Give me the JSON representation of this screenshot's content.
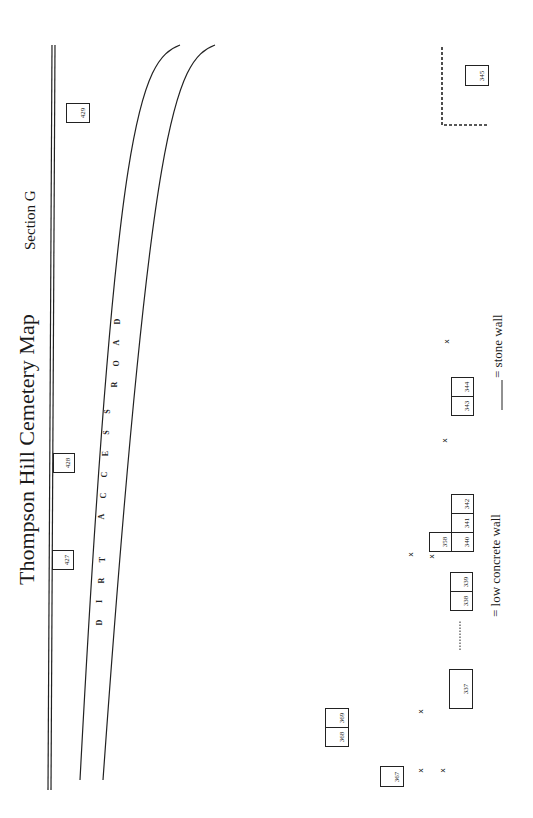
{
  "title": "Thompson Hill Cemetery Map",
  "section": "Section G",
  "road_label": [
    "D",
    "I",
    "R",
    "T",
    "A",
    "C",
    "C",
    "E",
    "S",
    "S",
    "R",
    "O",
    "A",
    "D"
  ],
  "legend": {
    "concrete": "= low concrete wall",
    "stone": "= stone wall"
  },
  "plots": [
    {
      "id": "429"
    },
    {
      "id": "428"
    },
    {
      "id": "427"
    },
    {
      "id": "345"
    },
    {
      "id": "344"
    },
    {
      "id": "343"
    },
    {
      "id": "342"
    },
    {
      "id": "341"
    },
    {
      "id": "340"
    },
    {
      "id": "358"
    },
    {
      "id": "339"
    },
    {
      "id": "338"
    },
    {
      "id": "337"
    },
    {
      "id": "369"
    },
    {
      "id": "368"
    },
    {
      "id": "367"
    }
  ],
  "markers": {
    "x": "x"
  }
}
